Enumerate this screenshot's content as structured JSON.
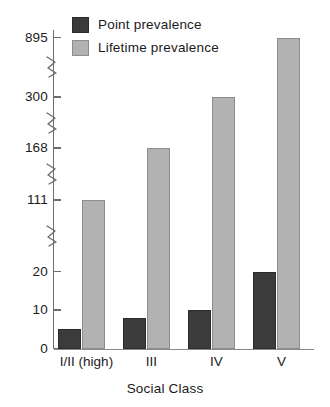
{
  "chart_data": {
    "type": "bar",
    "title": "",
    "xlabel": "Social Class",
    "ylabel": "",
    "grid": false,
    "legend_position": "top-left",
    "axis_note": "broken y-axis with four zig-zag breaks",
    "categories": [
      "I/II (high)",
      "III",
      "IV",
      "V"
    ],
    "ytick_labels": [
      "0",
      "10",
      "20",
      "111",
      "168",
      "300",
      "895"
    ],
    "ytick_values": [
      0,
      10,
      20,
      111,
      168,
      300,
      895
    ],
    "series": [
      {
        "name": "Point prevalence",
        "color": "#3b3b3b",
        "values": [
          5,
          8,
          10,
          20
        ]
      },
      {
        "name": "Lifetime prevalence",
        "color": "#b2b2b2",
        "values": [
          111,
          168,
          300,
          895
        ]
      }
    ]
  },
  "legend": {
    "items": [
      {
        "label": "Point prevalence"
      },
      {
        "label": "Lifetime prevalence"
      }
    ]
  },
  "axes": {
    "x_title": "Social Class",
    "categories": [
      "I/II (high)",
      "III",
      "IV",
      "V"
    ],
    "y_ticks": [
      "895",
      "300",
      "168",
      "111",
      "20",
      "10",
      "0"
    ]
  },
  "colors": {
    "point_prevalence": "#3b3b3b",
    "lifetime_prevalence": "#b2b2b2",
    "axis": "#6d6d6d",
    "background": "#ffffff"
  }
}
